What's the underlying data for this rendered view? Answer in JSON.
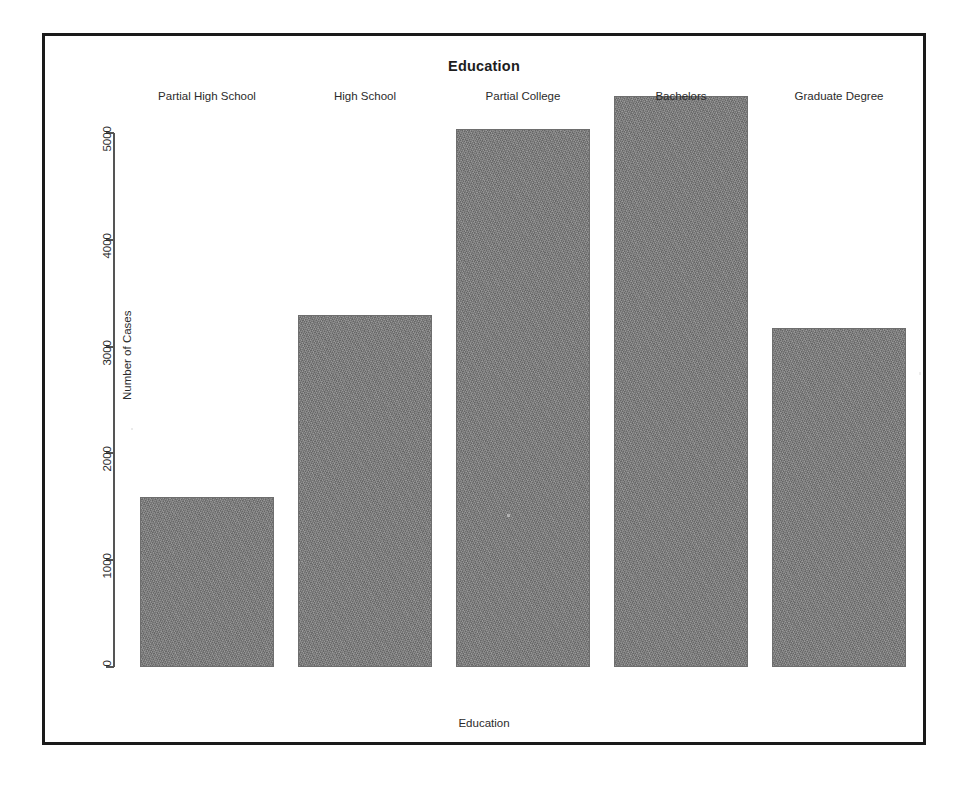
{
  "page": {
    "background": "#ffffff",
    "scan_artifact_top": "",
    "frame_border_color": "#1a1a1a"
  },
  "chart_data": {
    "type": "bar",
    "title": "Education",
    "xlabel": "Education",
    "ylabel": "Number of Cases",
    "categories": [
      "Partial High School",
      "High School",
      "Partial College",
      "Bachelors",
      "Graduate Degree"
    ],
    "values": [
      1590,
      3300,
      5040,
      5350,
      3175
    ],
    "ylim": [
      0,
      5500
    ],
    "yticks": [
      0,
      1000,
      2000,
      3000,
      4000,
      5000
    ],
    "ytick_labels": [
      "0",
      "1000",
      "2000",
      "3000",
      "4000",
      "5000"
    ],
    "grid": false,
    "legend": null,
    "bar_color": "#808080",
    "bar_border_color": "#6e6e6e",
    "axis_color": "#555555",
    "tick_label_rotation_y": 90,
    "tick_label_rotation_x": 0
  }
}
